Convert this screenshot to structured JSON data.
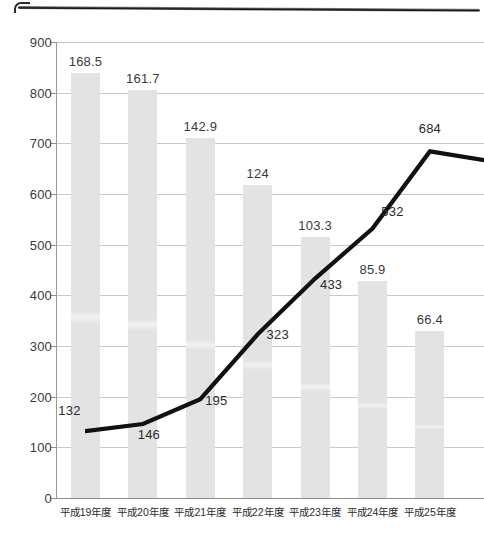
{
  "chart_data": {
    "type": "bar",
    "title": "",
    "subtitle": "",
    "xlabel": "",
    "ylabel": "",
    "ylim": [
      0,
      900
    ],
    "ytick_step": 100,
    "yticks": [
      "0",
      "100",
      "200",
      "300",
      "400",
      "500",
      "600",
      "700",
      "800",
      "900"
    ],
    "grid": true,
    "legend": "none",
    "categories": [
      "平成19年度",
      "平成20年度",
      "平成21年度",
      "平成22年度",
      "平成23年度",
      "平成24年度",
      "平成25年度"
    ],
    "series": [
      {
        "name": "bar-series",
        "type": "bar",
        "axis": "secondary",
        "values": [
          168.5,
          161.7,
          142.9,
          124,
          103.3,
          85.9,
          66.4
        ],
        "labels": [
          "168.5",
          "161.7",
          "142.9",
          "124",
          "103.3",
          "85.9",
          "66.4"
        ]
      },
      {
        "name": "line-series",
        "type": "line",
        "axis": "primary",
        "values": [
          132,
          146,
          195,
          323,
          433,
          532,
          684
        ],
        "labels": [
          "132",
          "146",
          "195",
          "323",
          "433",
          "532",
          "684"
        ]
      }
    ]
  },
  "axis": {
    "y_max_label": "900",
    "y_min_label": "0"
  }
}
